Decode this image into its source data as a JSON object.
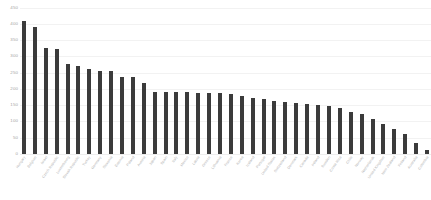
{
  "chart_data": {
    "type": "bar",
    "title": "",
    "xlabel": "",
    "ylabel": "",
    "ylim": [
      0,
      450
    ],
    "ytick_step": 50,
    "yticks": [
      450,
      400,
      350,
      300,
      250,
      200,
      150,
      100,
      50,
      0
    ],
    "grid": true,
    "legend": false,
    "bar_color": "#3b3b3b",
    "gridline_color": "#f2f2f2",
    "background_color": "#ffffff",
    "axis_label_color": "#a6a6a6",
    "categories": [
      "Hungary",
      "Belgium",
      "Israel",
      "Czech Republic",
      "Luxembourg",
      "Slovak Republic",
      "Turkey",
      "Germany",
      "Slovenia",
      "Estonia",
      "Poland",
      "Austria",
      "Japan",
      "Spain",
      "Italy",
      "Mexico",
      "Latvia",
      "Greece",
      "Lithuania",
      "France",
      "Korea",
      "Iceland",
      "Portugal",
      "United States",
      "Switzerland",
      "Denmark",
      "Canada",
      "Ireland",
      "Sweden",
      "Costa Rica",
      "Chile",
      "Norway",
      "Netherlands",
      "United Kingdom",
      "New Zealand",
      "Finland",
      "Australia",
      "Colombia"
    ],
    "values": [
      410,
      390,
      325,
      323,
      277,
      270,
      261,
      255,
      254,
      237,
      236,
      218,
      192,
      191,
      190,
      189,
      188,
      187,
      186,
      185,
      178,
      172,
      168,
      163,
      160,
      158,
      155,
      152,
      148,
      140,
      130,
      122,
      108,
      92,
      78,
      62,
      34,
      12
    ]
  }
}
